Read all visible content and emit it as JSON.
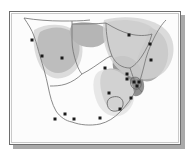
{
  "figure": {
    "title": "Southern Africa distribution map",
    "caption": "",
    "region": "Southern Africa",
    "frame": {
      "border_color": "#6e6e6e",
      "inner_rule_color": "#c9c9c9",
      "shadow_color": "#9a9a9a",
      "background_color": "#fdfdfd"
    }
  },
  "map": {
    "projection_note": "",
    "land_fill": "#fcfcfc",
    "coastline_color": "#7a7a7a",
    "border_color": "#6f6f6f",
    "ocean_fill": "#ffffff",
    "shading_levels": [
      {
        "id": "light",
        "label": "light",
        "color": "#d6d6d6"
      },
      {
        "id": "medium",
        "label": "medium",
        "color": "#b6b6b6"
      },
      {
        "id": "dark",
        "label": "dark",
        "color": "#939393"
      }
    ],
    "marker": {
      "shape": "square",
      "color": "#1a1a1a",
      "size_px": 3,
      "label": "locality record"
    },
    "countries": [
      {
        "name": "Namibia"
      },
      {
        "name": "Botswana"
      },
      {
        "name": "Zimbabwe"
      },
      {
        "name": "Mozambique"
      },
      {
        "name": "South Africa"
      },
      {
        "name": "Lesotho"
      },
      {
        "name": "Swaziland"
      },
      {
        "name": "Angola"
      },
      {
        "name": "Zambia"
      }
    ],
    "markers": [
      {
        "id": "m1",
        "x": 32,
        "y": 44
      },
      {
        "id": "m2",
        "x": 52,
        "y": 46
      },
      {
        "id": "m3",
        "x": 22,
        "y": 28
      },
      {
        "id": "m4",
        "x": 119,
        "y": 23
      },
      {
        "id": "m5",
        "x": 140,
        "y": 32
      },
      {
        "id": "m6",
        "x": 141,
        "y": 48
      },
      {
        "id": "m7",
        "x": 95,
        "y": 56
      },
      {
        "id": "m8",
        "x": 117,
        "y": 62
      },
      {
        "id": "m9",
        "x": 117,
        "y": 67
      },
      {
        "id": "m10",
        "x": 124,
        "y": 70
      },
      {
        "id": "m11",
        "x": 129,
        "y": 70
      },
      {
        "id": "m12",
        "x": 127,
        "y": 74
      },
      {
        "id": "m13",
        "x": 99,
        "y": 81
      },
      {
        "id": "m14",
        "x": 121,
        "y": 86
      },
      {
        "id": "m15",
        "x": 110,
        "y": 97
      },
      {
        "id": "m16",
        "x": 90,
        "y": 106
      },
      {
        "id": "m17",
        "x": 64,
        "y": 107
      },
      {
        "id": "m18",
        "x": 45,
        "y": 107
      },
      {
        "id": "m19",
        "x": 55,
        "y": 102
      }
    ],
    "marker_count": 19
  },
  "chart_data": {
    "type": "map",
    "title": "Southern Africa distribution map",
    "subtitle": "",
    "xlabel": "",
    "ylabel": "",
    "legend_position": "none",
    "grid": false,
    "series": [
      {
        "name": "locality records",
        "symbol": "filled square",
        "color": "#1a1a1a",
        "count": 19,
        "points": [
          [
            32,
            44
          ],
          [
            52,
            46
          ],
          [
            22,
            28
          ],
          [
            119,
            23
          ],
          [
            140,
            32
          ],
          [
            141,
            48
          ],
          [
            95,
            56
          ],
          [
            117,
            62
          ],
          [
            117,
            67
          ],
          [
            124,
            70
          ],
          [
            129,
            70
          ],
          [
            127,
            74
          ],
          [
            99,
            81
          ],
          [
            121,
            86
          ],
          [
            110,
            97
          ],
          [
            90,
            106
          ],
          [
            64,
            107
          ],
          [
            45,
            107
          ],
          [
            55,
            102
          ]
        ]
      },
      {
        "name": "shaded distribution zones",
        "symbol": "area",
        "levels": [
          "#d6d6d6",
          "#b6b6b6",
          "#939393"
        ],
        "count": 3
      }
    ]
  }
}
